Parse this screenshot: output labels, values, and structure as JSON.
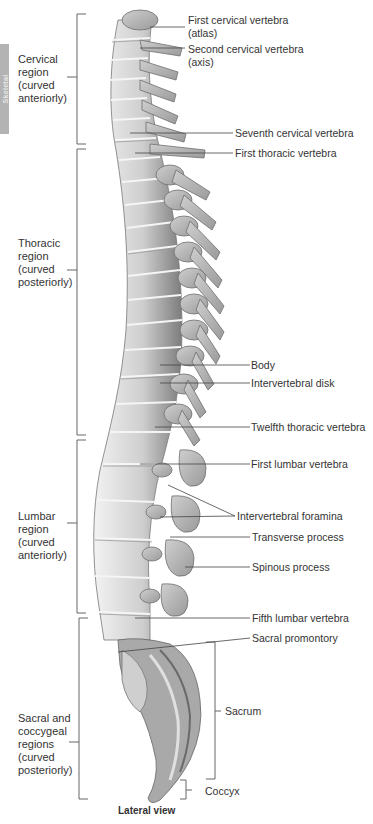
{
  "side_tab": {
    "label": "Skeletal",
    "color": "#b3b3b3"
  },
  "regions": [
    {
      "id": "cervical",
      "lines": [
        "Cervical",
        "region",
        "(curved",
        "anteriorly)"
      ],
      "bracket_top": 14,
      "bracket_bottom": 144
    },
    {
      "id": "thoracic",
      "lines": [
        "Thoracic",
        "region",
        "(curved",
        "posteriorly)"
      ],
      "bracket_top": 149,
      "bracket_bottom": 435
    },
    {
      "id": "lumbar",
      "lines": [
        "Lumbar",
        "region",
        "(curved",
        "anteriorly)"
      ],
      "bracket_top": 440,
      "bracket_bottom": 613
    },
    {
      "id": "sacral-coccygeal",
      "lines": [
        "Sacral and",
        "coccygeal",
        "regions",
        "(curved",
        "posteriorly)"
      ],
      "bracket_top": 618,
      "bracket_bottom": 799
    }
  ],
  "callouts": [
    {
      "id": "first-cervical",
      "lines": [
        "First cervical vertebra",
        "(atlas)"
      ]
    },
    {
      "id": "second-cervical",
      "lines": [
        "Second cervical vertebra",
        "(axis)"
      ]
    },
    {
      "id": "seventh-cervical",
      "lines": [
        "Seventh cervical vertebra"
      ]
    },
    {
      "id": "first-thoracic",
      "lines": [
        "First thoracic vertebra"
      ]
    },
    {
      "id": "body",
      "lines": [
        "Body"
      ]
    },
    {
      "id": "intervertebral-disk",
      "lines": [
        "Intervertebral disk"
      ]
    },
    {
      "id": "twelfth-thoracic",
      "lines": [
        "Twelfth thoracic vertebra"
      ]
    },
    {
      "id": "first-lumbar",
      "lines": [
        "First lumbar vertebra"
      ]
    },
    {
      "id": "intervertebral-foramina",
      "lines": [
        "Intervertebral foramina"
      ]
    },
    {
      "id": "transverse-process",
      "lines": [
        "Transverse process"
      ]
    },
    {
      "id": "spinous-process",
      "lines": [
        "Spinous process"
      ]
    },
    {
      "id": "fifth-lumbar",
      "lines": [
        "Fifth lumbar vertebra"
      ]
    },
    {
      "id": "sacral-promontory",
      "lines": [
        "Sacral promontory"
      ]
    },
    {
      "id": "sacrum",
      "lines": [
        "Sacrum"
      ]
    },
    {
      "id": "coccyx",
      "lines": [
        "Coccyx"
      ]
    }
  ],
  "caption": "Lateral view",
  "colors": {
    "bone": "#d8d8d8",
    "bone_shadow": "#8a8a8a",
    "line": "#555555",
    "text": "#333333"
  }
}
